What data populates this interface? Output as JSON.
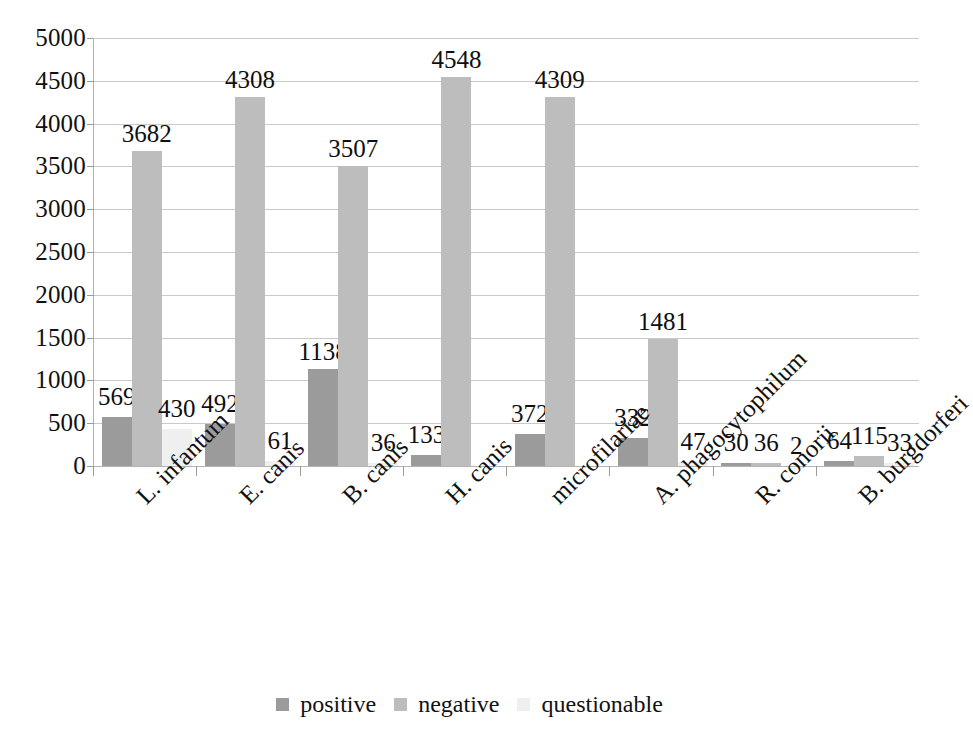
{
  "chart_data": {
    "type": "bar",
    "title": "",
    "subtitle": "",
    "xlabel": "",
    "ylabel": "",
    "ylim": [
      0,
      5000
    ],
    "ytick_values": [
      0,
      500,
      1000,
      1500,
      2000,
      2500,
      3000,
      3500,
      4000,
      4500,
      5000
    ],
    "ytick_labels": [
      "0",
      "500",
      "1000",
      "1500",
      "2000",
      "2500",
      "3000",
      "3500",
      "4000",
      "4500",
      "5000"
    ],
    "grid": true,
    "legend_position": "bottom",
    "categories": [
      "L. infantum",
      "E. canis",
      "B. canis",
      "H. canis",
      "microfilariae",
      "A. phagocytophilum",
      "R. conorii",
      "B. burgdorferi"
    ],
    "series": [
      {
        "name": "positive",
        "color": "#9b9b9b",
        "values": [
          569,
          492,
          1138,
          133,
          372,
          332,
          30,
          64
        ],
        "labels": [
          "569",
          "492",
          "1138",
          "133",
          "372",
          "332",
          "30",
          "64"
        ]
      },
      {
        "name": "negative",
        "color": "#bdbdbd",
        "values": [
          3682,
          4308,
          3507,
          4548,
          4309,
          1481,
          36,
          115
        ],
        "labels": [
          "3682",
          "4308",
          "3507",
          "4548",
          "4309",
          "1481",
          "36",
          "115"
        ]
      },
      {
        "name": "questionable",
        "color": "#efefef",
        "values": [
          430,
          61,
          36,
          0,
          0,
          47,
          2,
          33
        ],
        "labels": [
          "430",
          "61",
          "36",
          "",
          "",
          "47",
          "2",
          "33"
        ]
      }
    ]
  },
  "legend": {
    "items": [
      {
        "label": "positive",
        "swatch": "positive"
      },
      {
        "label": "negative",
        "swatch": "negative"
      },
      {
        "label": "questionable",
        "swatch": "questionable"
      }
    ]
  }
}
